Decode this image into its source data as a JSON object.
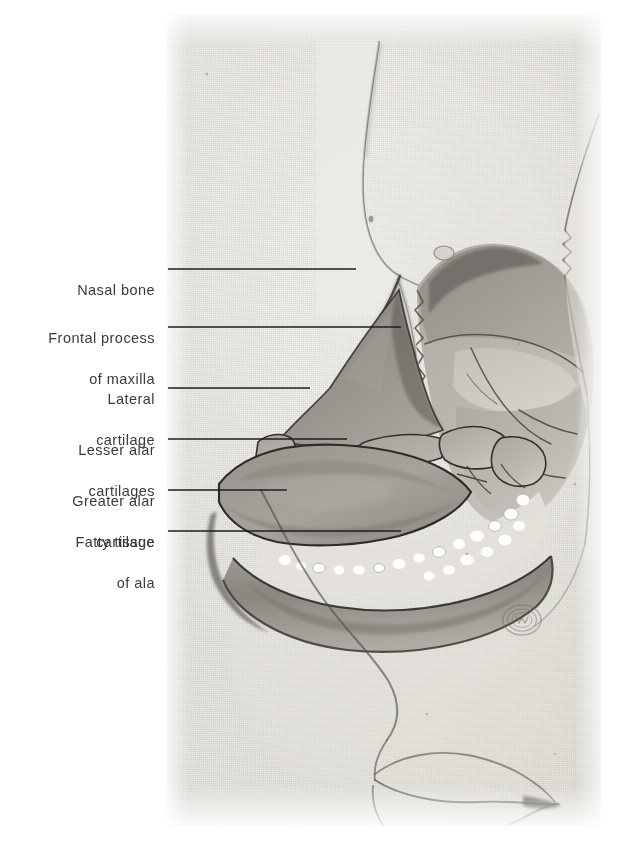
{
  "figure": {
    "kind": "anatomical-plate",
    "plate_background_color": "#eae8e3",
    "page_background_color": "#ffffff",
    "label_text_color": "#3a3a3a",
    "leader_line_color": "#1e1e1e"
  },
  "labels": [
    {
      "id": "nasal-bone",
      "lines": [
        "Nasal bone"
      ],
      "text_right_x": 155,
      "text_baseline_y": 269,
      "leader": {
        "x1": 168,
        "y1": 269,
        "x2": 356,
        "y2": 269
      }
    },
    {
      "id": "frontal-process-of-maxilla",
      "lines": [
        "Frontal process",
        "of maxilla"
      ],
      "text_right_x": 155,
      "text_baseline_y": 317,
      "leader": {
        "x1": 168,
        "y1": 327,
        "x2": 401,
        "y2": 327
      }
    },
    {
      "id": "lateral-cartilage",
      "lines": [
        "Lateral",
        "cartilage"
      ],
      "text_right_x": 155,
      "text_baseline_y": 378,
      "leader": {
        "x1": 168,
        "y1": 388,
        "x2": 310,
        "y2": 388
      }
    },
    {
      "id": "lesser-alar-cartilages",
      "lines": [
        "Lesser alar",
        "cartilages"
      ],
      "text_right_x": 155,
      "text_baseline_y": 429,
      "leader": {
        "x1": 168,
        "y1": 439,
        "x2": 347,
        "y2": 439
      }
    },
    {
      "id": "greater-alar-cartilage",
      "lines": [
        "Greater alar",
        "cartilage"
      ],
      "text_right_x": 155,
      "text_baseline_y": 480,
      "leader": {
        "x1": 168,
        "y1": 490,
        "x2": 287,
        "y2": 490
      }
    },
    {
      "id": "fatty-tissue-of-ala",
      "lines": [
        "Fatty tissue",
        "of ala"
      ],
      "text_right_x": 155,
      "text_baseline_y": 520,
      "leader": {
        "x1": 168,
        "y1": 531,
        "x2": 401,
        "y2": 531
      }
    }
  ],
  "plate_features": [
    {
      "id": "nasal-bone-region",
      "name": "nasal bone"
    },
    {
      "id": "frontal-process-region",
      "name": "frontal process of maxilla"
    },
    {
      "id": "lateral-cartilage-region",
      "name": "lateral cartilage"
    },
    {
      "id": "lesser-alar-region",
      "name": "lesser alar cartilages"
    },
    {
      "id": "greater-alar-region",
      "name": "greater alar cartilage"
    },
    {
      "id": "fatty-tissue-region",
      "name": "fatty tissue of ala"
    },
    {
      "id": "nasal-dorsum-profile",
      "name": "skin profile of nose"
    },
    {
      "id": "upper-lip-profile",
      "name": "upper lip"
    },
    {
      "id": "lower-lip-profile",
      "name": "lower lip"
    },
    {
      "id": "orbital-margin",
      "name": "orbital margin"
    },
    {
      "id": "publisher-stamp",
      "name": "publisher embossed stamp"
    }
  ]
}
